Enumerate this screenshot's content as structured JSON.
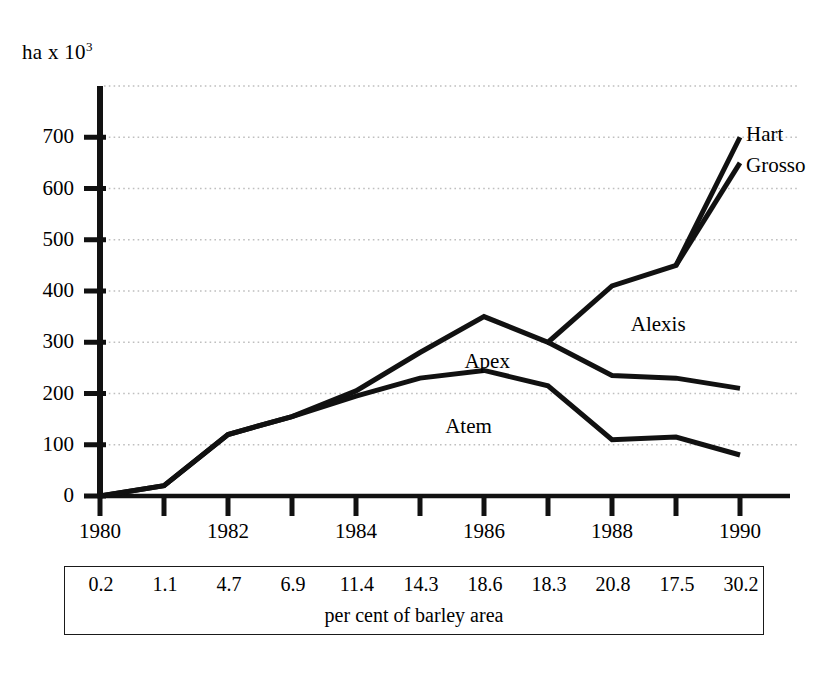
{
  "chart_data": {
    "type": "line",
    "title": "",
    "subtitle": "",
    "xlabel": "",
    "ylabel": "ha x 10",
    "ylabel_exponent": "3",
    "ylim": [
      0,
      800
    ],
    "xlim": [
      1980,
      1990
    ],
    "grid": true,
    "grid_axis": "y",
    "legend_position": "inline-annotations",
    "yticks": [
      0,
      100,
      200,
      300,
      400,
      500,
      600,
      700
    ],
    "ytick_labels": [
      "0",
      "100",
      "200",
      "300",
      "400",
      "500",
      "600",
      "700"
    ],
    "xticks": [
      1980,
      1981,
      1982,
      1983,
      1984,
      1985,
      1986,
      1987,
      1988,
      1989,
      1990
    ],
    "xtick_labels": [
      "1980",
      "",
      "1982",
      "",
      "1984",
      "",
      "1986",
      "",
      "1988",
      "",
      "1990"
    ],
    "x": [
      1980,
      1981,
      1982,
      1983,
      1984,
      1985,
      1986,
      1987,
      1988,
      1989,
      1990
    ],
    "series": [
      {
        "name": "Hart",
        "label": "Hart",
        "x": [
          1980,
          1981,
          1982,
          1983,
          1984,
          1985,
          1986,
          1987,
          1988,
          1989,
          1990
        ],
        "values": [
          0,
          20,
          120,
          155,
          205,
          280,
          350,
          300,
          410,
          450,
          700
        ]
      },
      {
        "name": "Grosso",
        "label": "Grosso",
        "x": [
          1990
        ],
        "values": [
          650
        ]
      },
      {
        "name": "Alexis",
        "label": "Alexis",
        "x": [
          1987,
          1988,
          1989,
          1990
        ],
        "values": [
          300,
          235,
          230,
          210
        ]
      },
      {
        "name": "Apex",
        "label": "Apex",
        "x": [
          1980,
          1981,
          1982,
          1983,
          1984,
          1985,
          1986,
          1987,
          1988,
          1989,
          1990
        ],
        "values": [
          0,
          20,
          120,
          155,
          195,
          230,
          245,
          215,
          110,
          115,
          80
        ]
      },
      {
        "name": "Atem",
        "label": "Atem",
        "x": [],
        "values": []
      }
    ],
    "annotations": [
      {
        "text": "Hart",
        "x": 1990,
        "y": 700
      },
      {
        "text": "Grosso",
        "x": 1990,
        "y": 640
      },
      {
        "text": "Alexis",
        "x": 1988.2,
        "y": 330
      },
      {
        "text": "Apex",
        "x": 1985.6,
        "y": 258
      },
      {
        "text": "Atem",
        "x": 1985.3,
        "y": 130
      }
    ],
    "footer_table": {
      "caption": "per cent of barley area",
      "values": [
        "0.2",
        "1.1",
        "4.7",
        "6.9",
        "11.4",
        "14.3",
        "18.6",
        "18.3",
        "20.8",
        "17.5",
        "30.2"
      ]
    }
  },
  "colors": {
    "line": "#111111",
    "axis": "#111111",
    "grid": "#bfbfbf",
    "background": "#ffffff",
    "text": "#000000"
  }
}
